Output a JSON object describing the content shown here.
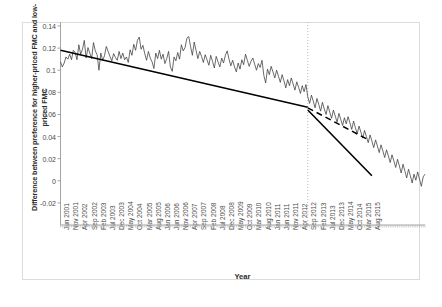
{
  "chart_data": {
    "type": "line",
    "title": "",
    "xlabel": "Year",
    "ylabel": "Difference between preference for higher-priced FMC and low-priced FMC",
    "ylim": [
      -0.04,
      0.14
    ],
    "yticks": [
      0.14,
      0.12,
      0.1,
      0.08,
      0.06,
      0.04,
      0.02,
      0,
      -0.02
    ],
    "ytick_labels": [
      "0.14",
      "0.12",
      "0.1",
      "0.08",
      "0.06",
      "0.04",
      "0.02",
      "0",
      "-0.02"
    ],
    "grid": false,
    "legend": "none",
    "x_tick_labels": [
      "Jun 2001",
      "Nov 2001",
      "Apr 2002",
      "Sep 2002",
      "Feb 2003",
      "Jul 2003",
      "Dec 2003",
      "May 2004",
      "Oct 2004",
      "Mar 2005",
      "Aug 2005",
      "Jan 2006",
      "Jun 2006",
      "Nov 2006",
      "Apr 2007",
      "Sep 2007",
      "Feb 2008",
      "Jul 2008",
      "Dec 2008",
      "May 2009",
      "Oct 2009",
      "Mar 2010",
      "Aug 2010",
      "Jan 2011",
      "Jun 2011",
      "Nov 2011",
      "Apr 2012",
      "Sep 2012",
      "Feb 2013",
      "Jul 2013",
      "Dec 2013",
      "May 2014",
      "Oct 2014",
      "Mar 2015",
      "Aug 2015"
    ],
    "x_tick_interval_months": 5,
    "x_start": "Jun 2001",
    "x_end": "Aug 2015",
    "intervention": {
      "label": "Sep 2012",
      "index": 135,
      "line_style": "dotted",
      "color": "#b4b4b4"
    },
    "series": [
      {
        "name": "Observed monthly difference",
        "style": "solid-thin",
        "color": "#3a3a3a",
        "values": [
          0.1075,
          0.103,
          0.1065,
          0.112,
          0.11,
          0.1145,
          0.1095,
          0.118,
          0.116,
          0.1095,
          0.123,
          0.1145,
          0.119,
          0.127,
          0.111,
          0.1205,
          0.1155,
          0.1105,
          0.125,
          0.1175,
          0.114,
          0.1,
          0.1155,
          0.109,
          0.113,
          0.1215,
          0.117,
          0.1125,
          0.1085,
          0.115,
          0.1115,
          0.109,
          0.117,
          0.1105,
          0.1155,
          0.1095,
          0.112,
          0.107,
          0.1185,
          0.1135,
          0.1235,
          0.118,
          0.127,
          0.13,
          0.119,
          0.1225,
          0.115,
          0.109,
          0.117,
          0.111,
          0.1075,
          0.1015,
          0.1155,
          0.1105,
          0.118,
          0.11,
          0.1145,
          0.106,
          0.1105,
          0.117,
          0.103,
          0.099,
          0.112,
          0.1085,
          0.116,
          0.11,
          0.123,
          0.1175,
          0.1205,
          0.129,
          0.1305,
          0.1215,
          0.1135,
          0.1255,
          0.118,
          0.1105,
          0.117,
          0.1125,
          0.107,
          0.114,
          0.1095,
          0.1045,
          0.1135,
          0.108,
          0.102,
          0.1125,
          0.1075,
          0.103,
          0.111,
          0.1065,
          0.1135,
          0.1175,
          0.11,
          0.104,
          0.109,
          0.103,
          0.0985,
          0.1065,
          0.101,
          0.1095,
          0.105,
          0.1145,
          0.109,
          0.1035,
          0.108,
          0.111,
          0.1055,
          0.1,
          0.106,
          0.1025,
          0.109,
          0.0955,
          0.0885,
          0.101,
          0.096,
          0.1035,
          0.0985,
          0.093,
          0.1,
          0.0945,
          0.089,
          0.096,
          0.0905,
          0.084,
          0.0915,
          0.086,
          0.093,
          0.0875,
          0.082,
          0.0895,
          0.0845,
          0.079,
          0.086,
          0.0805,
          0.087,
          0.076,
          0.07,
          0.0775,
          0.072,
          0.066,
          0.0745,
          0.069,
          0.063,
          0.071,
          0.065,
          0.06,
          0.068,
          0.062,
          0.0565,
          0.064,
          0.0585,
          0.053,
          0.061,
          0.0555,
          0.05,
          0.057,
          0.0515,
          0.058,
          0.0525,
          0.0465,
          0.054,
          0.048,
          0.0425,
          0.0495,
          0.044,
          0.0385,
          0.0455,
          0.04,
          0.0345,
          0.0415,
          0.036,
          0.03,
          0.037,
          0.0315,
          0.0255,
          0.0325,
          0.027,
          0.021,
          0.028,
          0.0225,
          0.0165,
          0.0235,
          0.018,
          0.012,
          0.0195,
          0.0135,
          0.007,
          0.015,
          0.009,
          0.0025,
          0.0105,
          0.0045,
          -0.002,
          0.006,
          0.0005,
          0.008,
          0.0015,
          -0.005,
          0.0035,
          0.006
        ]
      },
      {
        "name": "Fitted trend (pre-intervention)",
        "style": "solid-thick",
        "color": "#000000",
        "segment": "pre",
        "start_value": 0.118,
        "end_value": 0.0665,
        "start_index": 0,
        "end_index": 135
      },
      {
        "name": "Fitted trend (post-intervention)",
        "style": "solid-thick",
        "color": "#000000",
        "segment": "post",
        "start_value": 0.064,
        "end_value": 0.0045,
        "start_index": 135,
        "end_index": 170
      },
      {
        "name": "Counterfactual projection",
        "style": "dashed",
        "color": "#000000",
        "segment": "projection",
        "start_value": 0.066,
        "end_value": 0.038,
        "start_index": 135,
        "end_index": 167
      }
    ]
  }
}
